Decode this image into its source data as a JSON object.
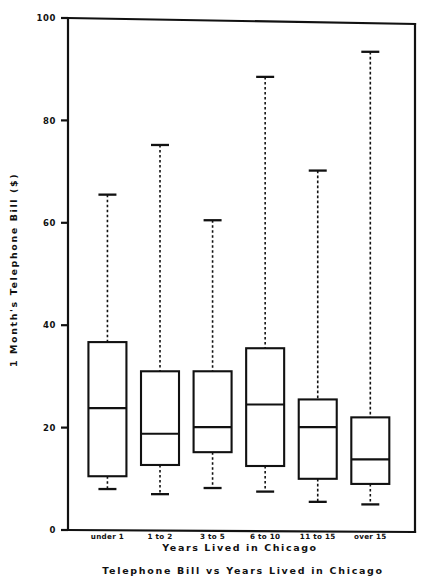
{
  "chart_data": {
    "type": "box",
    "title": "Telephone Bill vs Years Lived in Chicago",
    "xlabel": "Years Lived in Chicago",
    "ylabel": "1 Month's Telephone Bill ($)",
    "ylim": [
      0,
      100
    ],
    "yticks": [
      0,
      20,
      40,
      60,
      80,
      100
    ],
    "ytick_labels": [
      "0",
      "20",
      "40",
      "60",
      "80",
      "100"
    ],
    "grid": false,
    "legend": "none",
    "categories": [
      "under 1",
      "1 to 2",
      "3 to 5",
      "6 to 10",
      "11 to 15",
      "over 15"
    ],
    "boxes": [
      {
        "category": "under 1",
        "whisker_low": 8.0,
        "q1": 10.5,
        "median": 23.8,
        "q3": 36.7,
        "whisker_high": 65.5
      },
      {
        "category": "1 to 2",
        "whisker_low": 7.0,
        "q1": 12.7,
        "median": 18.8,
        "q3": 31.0,
        "whisker_high": 75.2
      },
      {
        "category": "3 to 5",
        "whisker_low": 8.2,
        "q1": 15.2,
        "median": 20.1,
        "q3": 31.0,
        "whisker_high": 60.5
      },
      {
        "category": "6 to 10",
        "whisker_low": 7.5,
        "q1": 12.5,
        "median": 24.5,
        "q3": 35.5,
        "whisker_high": 88.5
      },
      {
        "category": "11 to 15",
        "whisker_low": 5.5,
        "q1": 10.0,
        "median": 20.1,
        "q3": 25.5,
        "whisker_high": 70.2
      },
      {
        "category": "over 15",
        "whisker_low": 5.0,
        "q1": 9.0,
        "median": 13.8,
        "q3": 22.0,
        "whisker_high": 93.4
      }
    ]
  },
  "style": {
    "ink_color": "#111111",
    "background_color": "#ffffff"
  }
}
